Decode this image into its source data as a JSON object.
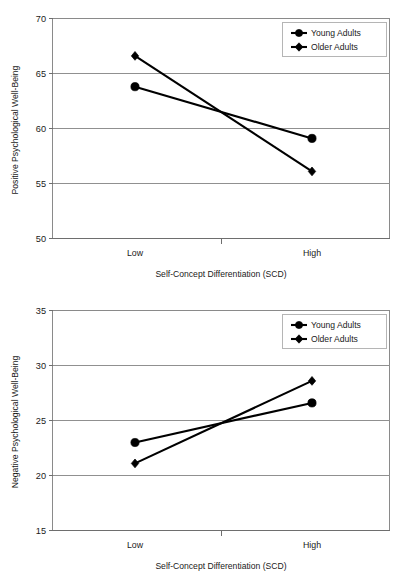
{
  "figure": {
    "panels": [
      "positive",
      "negative"
    ]
  },
  "chart_data": [
    {
      "type": "line",
      "id": "positive",
      "title": "",
      "xlabel": "Self-Concept Differentiation (SCD)",
      "ylabel": "Positive Psychological Well-Being",
      "categories": [
        "Low",
        "High"
      ],
      "ylim": [
        50,
        70
      ],
      "yticks": [
        50,
        55,
        60,
        65,
        70
      ],
      "ytick_labels": [
        "50",
        "55",
        "60",
        "65",
        "70"
      ],
      "grid": true,
      "legend_position": "top-right",
      "series": [
        {
          "name": "Young Adults",
          "marker": "circle",
          "color": "#000000",
          "values": [
            63.8,
            59.1
          ]
        },
        {
          "name": "Older Adults",
          "marker": "diamond",
          "color": "#000000",
          "values": [
            66.6,
            56.1
          ]
        }
      ]
    },
    {
      "type": "line",
      "id": "negative",
      "title": "",
      "xlabel": "Self-Concept Differentiation (SCD)",
      "ylabel": "Negative Psychological Well-Being",
      "categories": [
        "Low",
        "High"
      ],
      "ylim": [
        15,
        35
      ],
      "yticks": [
        15,
        20,
        25,
        30,
        35
      ],
      "ytick_labels": [
        "15",
        "20",
        "25",
        "30",
        "35"
      ],
      "grid": true,
      "legend_position": "top-right",
      "series": [
        {
          "name": "Young Adults",
          "marker": "circle",
          "color": "#000000",
          "values": [
            23.0,
            26.6
          ]
        },
        {
          "name": "Older Adults",
          "marker": "diamond",
          "color": "#000000",
          "values": [
            21.1,
            28.6
          ]
        }
      ]
    }
  ]
}
